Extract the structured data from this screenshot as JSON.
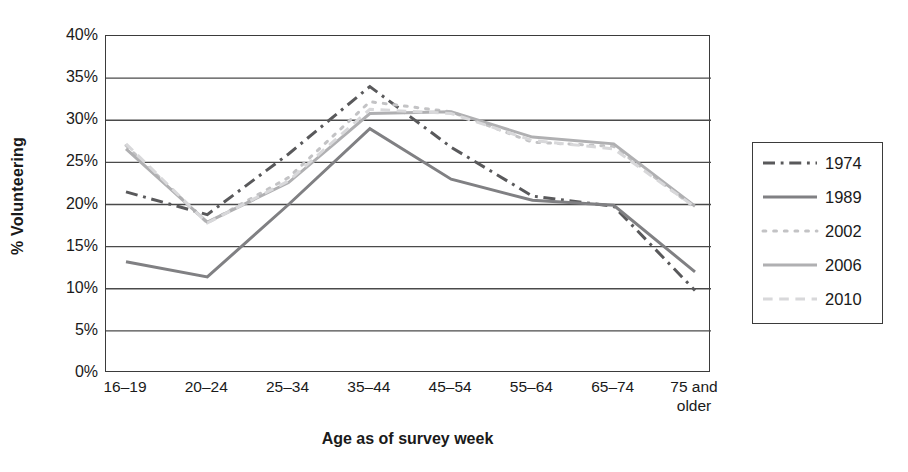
{
  "chart_data": {
    "type": "line",
    "title": "",
    "xlabel": "Age as of survey week",
    "ylabel": "% Volunteering",
    "categories": [
      "16–19",
      "20–24",
      "25–34",
      "35–44",
      "45–54",
      "55–64",
      "65–74",
      "75 and\nolder"
    ],
    "ylim": [
      0,
      40
    ],
    "yticks": [
      "0%",
      "5%",
      "10%",
      "15%",
      "20%",
      "25%",
      "30%",
      "35%",
      "40%"
    ],
    "ytick_values": [
      0,
      5,
      10,
      15,
      20,
      25,
      30,
      35,
      40
    ],
    "grid": "horizontal",
    "legend_position": "right",
    "series": [
      {
        "name": "1974",
        "style": "dash-dot",
        "color": "#59595b",
        "values": [
          21.5,
          18.8,
          26.0,
          34.0,
          26.8,
          21.0,
          19.8,
          9.8
        ]
      },
      {
        "name": "1989",
        "style": "solid",
        "color": "#808083",
        "values": [
          13.2,
          11.4,
          20.0,
          29.0,
          23.0,
          20.5,
          19.9,
          12.0
        ]
      },
      {
        "name": "2002",
        "style": "dotted",
        "color": "#c3c3c5",
        "values": [
          27.0,
          17.8,
          23.2,
          32.2,
          31.0,
          27.4,
          26.9,
          19.6
        ]
      },
      {
        "name": "2006",
        "style": "solid",
        "color": "#b0b0b2",
        "values": [
          26.6,
          17.9,
          22.6,
          30.8,
          31.0,
          28.0,
          27.2,
          19.8
        ]
      },
      {
        "name": "2010",
        "style": "dashed",
        "color": "#d8d8da",
        "values": [
          27.2,
          17.8,
          22.8,
          31.3,
          30.8,
          27.6,
          26.6,
          19.7
        ]
      }
    ]
  },
  "legend": {
    "items": [
      {
        "label": "1974"
      },
      {
        "label": "1989"
      },
      {
        "label": "2002"
      },
      {
        "label": "2006"
      },
      {
        "label": "2010"
      }
    ]
  },
  "colors": {
    "axis": "#3b3b3b",
    "grid": "#4a4a4a",
    "background": "#ffffff",
    "text": "#1a1a1a"
  }
}
